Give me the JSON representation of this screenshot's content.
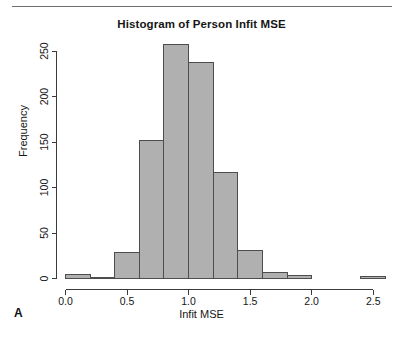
{
  "figure": {
    "panel_label": "A",
    "title": "Histogram of Person Infit MSE",
    "xlabel": "Infit MSE",
    "ylabel": "Frequency",
    "bar_fill": "#b0b0b0",
    "bar_stroke": "#4d4d4d",
    "axis_color": "#3a3a3a",
    "background": "#ffffff"
  },
  "chart_data": {
    "type": "bar",
    "title": "Histogram of Person Infit MSE",
    "xlabel": "Infit MSE",
    "ylabel": "Frequency",
    "bin_width": 0.2,
    "xlim": [
      0.0,
      2.6
    ],
    "ylim": [
      0,
      260
    ],
    "grid": false,
    "legend": "none",
    "xticks": [
      "0.0",
      "0.5",
      "1.0",
      "1.5",
      "2.0",
      "2.5"
    ],
    "xtick_values": [
      0.0,
      0.5,
      1.0,
      1.5,
      2.0,
      2.5
    ],
    "yticks": [
      "0",
      "50",
      "100",
      "150",
      "200",
      "250"
    ],
    "ytick_values": [
      0,
      50,
      100,
      150,
      200,
      250
    ],
    "bin_edges": [
      0.0,
      0.2,
      0.4,
      0.6,
      0.8,
      1.0,
      1.2,
      1.4,
      1.6,
      1.8,
      2.0,
      2.2,
      2.4,
      2.6
    ],
    "categories": [
      "0.0-0.2",
      "0.2-0.4",
      "0.4-0.6",
      "0.6-0.8",
      "0.8-1.0",
      "1.0-1.2",
      "1.2-1.4",
      "1.4-1.6",
      "1.6-1.8",
      "1.8-2.0",
      "2.0-2.2",
      "2.2-2.4",
      "2.4-2.6"
    ],
    "values": [
      4,
      1,
      29,
      152,
      257,
      238,
      117,
      31,
      7,
      3,
      0,
      0,
      2
    ]
  }
}
